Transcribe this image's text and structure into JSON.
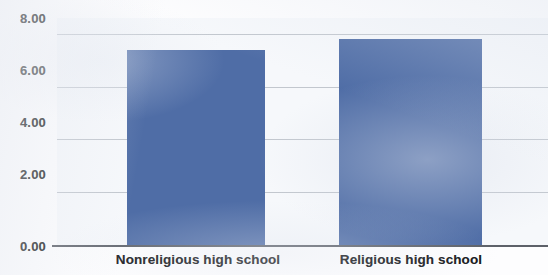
{
  "chart_data": {
    "type": "bar",
    "title": "",
    "subtitle": "",
    "xlabel": "",
    "ylabel": "",
    "categories": [
      "Nonreligious high school",
      "Religious high school"
    ],
    "values": [
      7.37,
      7.82
    ],
    "series": [
      {
        "name": "",
        "values": [
          7.37,
          7.82
        ]
      }
    ],
    "ylim": [
      0.0,
      8.6
    ],
    "yticks": [
      0.0,
      2.0,
      4.0,
      6.0,
      8.0
    ],
    "ytick_labels": [
      "0.00",
      "2.00",
      "4.00",
      "6.00",
      "8.00"
    ],
    "xtick_labels": [
      "Nonreligious high school",
      "Religious high school"
    ],
    "grid": true,
    "grid_axis": "y",
    "legend": false,
    "legend_position": "none",
    "annotations": [],
    "colors": {
      "bar": "#4f6da6",
      "gridline": "#b9bec6",
      "axis": "#5d6169",
      "plot_background": "#f6f8fb",
      "figure_background": "#fdfdfe",
      "tick_label": "#1d1f22",
      "category_label": "#15171a"
    }
  }
}
